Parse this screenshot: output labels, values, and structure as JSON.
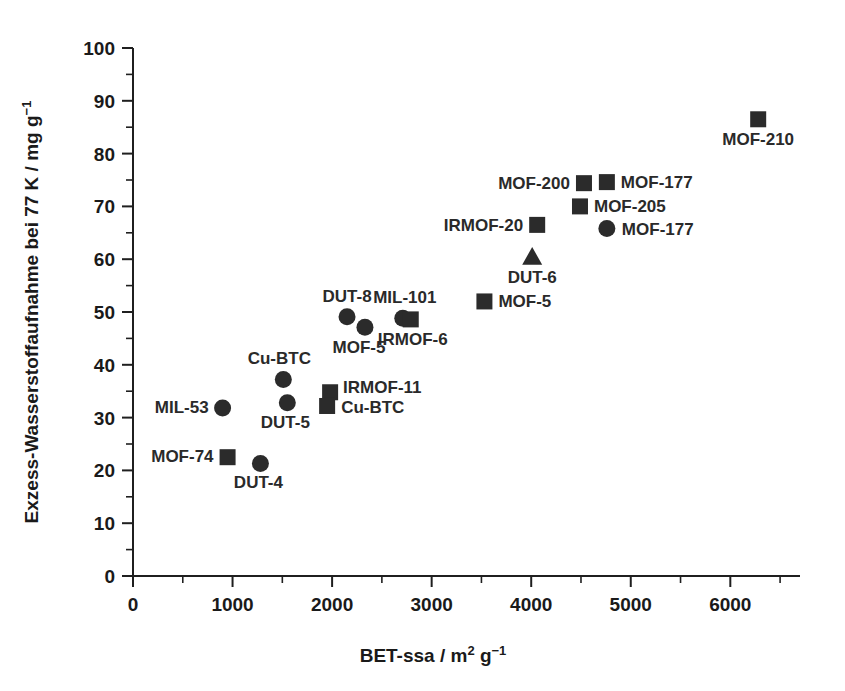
{
  "chart_data": {
    "type": "scatter",
    "title": "",
    "xlabel": "BET-ssa / m2 g-1",
    "ylabel": "Exzess-Wasserstoffaufnahme bei 77 K / mg g-1",
    "xlabel_parts": {
      "base": "BET-ssa / m",
      "sup1": "2",
      "mid": " g",
      "sup2": "−1"
    },
    "ylabel_parts": {
      "base": "Exzess-Wasserstoffaufnahme bei 77 K / mg g",
      "sup": "−1"
    },
    "xlim": [
      0,
      6700
    ],
    "ylim": [
      0,
      100
    ],
    "xticks": [
      0,
      1000,
      2000,
      3000,
      4000,
      5000,
      6000
    ],
    "xticklabels": [
      "0",
      "1000",
      "2000",
      "3000",
      "4000",
      "5000",
      "6000"
    ],
    "yticks": [
      0,
      10,
      20,
      30,
      40,
      50,
      60,
      70,
      80,
      90,
      100
    ],
    "yticklabels": [
      "0",
      "10",
      "20",
      "30",
      "40",
      "50",
      "60",
      "70",
      "80",
      "90",
      "100"
    ],
    "x_minor_step": 500,
    "y_minor_step": 5,
    "grid": false,
    "legend": false,
    "marker_color": "#2b2b2b",
    "axis_color": "#1f1f1f",
    "points": [
      {
        "label": "MIL-53",
        "x": 900,
        "y": 31.8,
        "marker": "circle",
        "label_dx": -14,
        "label_dy": 5,
        "anchor": "end"
      },
      {
        "label": "MOF-74",
        "x": 950,
        "y": 22.5,
        "marker": "square",
        "label_dx": -14,
        "label_dy": 5,
        "anchor": "end"
      },
      {
        "label": "DUT-4",
        "x": 1280,
        "y": 21.3,
        "marker": "circle",
        "label_dx": -2,
        "label_dy": 24,
        "anchor": "middle"
      },
      {
        "label": "Cu-BTC",
        "x": 1510,
        "y": 37.2,
        "marker": "circle",
        "label_dx": -4,
        "label_dy": -16,
        "anchor": "middle"
      },
      {
        "label": "DUT-5",
        "x": 1550,
        "y": 32.8,
        "marker": "circle",
        "label_dx": -2,
        "label_dy": 25,
        "anchor": "middle"
      },
      {
        "label": "IRMOF-11",
        "x": 1980,
        "y": 34.8,
        "marker": "square",
        "label_dx": 13,
        "label_dy": 1,
        "anchor": "start"
      },
      {
        "label": "Cu-BTC",
        "x": 1950,
        "y": 32.2,
        "marker": "square",
        "label_dx": 14,
        "label_dy": 7,
        "anchor": "start"
      },
      {
        "label": "DUT-8",
        "x": 2150,
        "y": 49.1,
        "marker": "circle",
        "label_dx": 0,
        "label_dy": -15,
        "anchor": "middle"
      },
      {
        "label": "MOF-5",
        "x": 2330,
        "y": 47.1,
        "marker": "circle",
        "label_dx": -6,
        "label_dy": 26,
        "anchor": "middle"
      },
      {
        "label": "MIL-101",
        "x": 2710,
        "y": 48.8,
        "marker": "circle",
        "label_dx": 2,
        "label_dy": -15,
        "anchor": "middle"
      },
      {
        "label": "IRMOF-6",
        "x": 2790,
        "y": 48.6,
        "marker": "square",
        "label_dx": 2,
        "label_dy": 26,
        "anchor": "middle"
      },
      {
        "label": "MOF-5",
        "x": 3530,
        "y": 52.0,
        "marker": "square",
        "label_dx": 14,
        "label_dy": 6,
        "anchor": "start"
      },
      {
        "label": "DUT-6",
        "x": 4010,
        "y": 60.5,
        "marker": "triangle",
        "label_dx": 0,
        "label_dy": 26,
        "anchor": "middle"
      },
      {
        "label": "IRMOF-20",
        "x": 4060,
        "y": 66.5,
        "marker": "square",
        "label_dx": -14,
        "label_dy": 6,
        "anchor": "end"
      },
      {
        "label": "MOF-200",
        "x": 4530,
        "y": 74.4,
        "marker": "square",
        "label_dx": -14,
        "label_dy": 6,
        "anchor": "end"
      },
      {
        "label": "MOF-177",
        "x": 4760,
        "y": 74.6,
        "marker": "square",
        "label_dx": 14,
        "label_dy": 6,
        "anchor": "start"
      },
      {
        "label": "MOF-205",
        "x": 4490,
        "y": 70.0,
        "marker": "square",
        "label_dx": 14,
        "label_dy": 6,
        "anchor": "start"
      },
      {
        "label": "MOF-177",
        "x": 4760,
        "y": 65.8,
        "marker": "circle",
        "label_dx": 15,
        "label_dy": 6,
        "anchor": "start"
      },
      {
        "label": "MOF-210",
        "x": 6280,
        "y": 86.5,
        "marker": "square",
        "label_dx": 0,
        "label_dy": 26,
        "anchor": "middle"
      }
    ]
  },
  "figure": {
    "background": "#ffffff",
    "caption": ""
  }
}
